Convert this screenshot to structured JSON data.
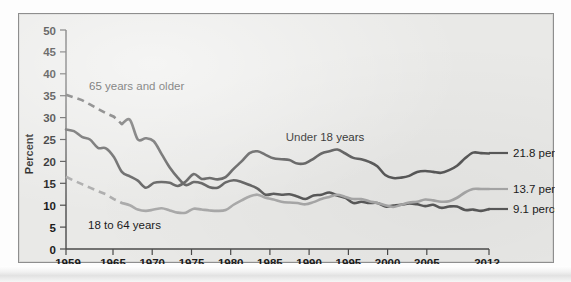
{
  "figure": {
    "y_axis_title": "Percent",
    "background_color": "#e9e9e7",
    "border_color": "#8e8e8e"
  },
  "labels": {
    "series_65": "65 years and older",
    "series_18_64": "18 to 64 years",
    "series_under18": "Under 18 years",
    "end_under18": "21.8 percent",
    "end_18_64": "13.7 percent",
    "end_65": "9.1 percent"
  },
  "chart_data": {
    "type": "line",
    "title": "",
    "xlabel": "",
    "ylabel": "Percent",
    "xlim": [
      1959,
      2012
    ],
    "ylim": [
      0,
      50
    ],
    "ytick_labels": [
      "0",
      "5",
      "10",
      "15",
      "20",
      "25",
      "30",
      "35",
      "40",
      "45",
      "50"
    ],
    "ytick_values": [
      0,
      5,
      10,
      15,
      20,
      25,
      30,
      35,
      40,
      45,
      50
    ],
    "xtick_labels": [
      "1959",
      "1965",
      "1970",
      "1975",
      "1980",
      "1985",
      "1990",
      "1995",
      "2000",
      "2005",
      "2012"
    ],
    "xtick_values": [
      1959,
      1965,
      1970,
      1975,
      1980,
      1985,
      1990,
      1995,
      2000,
      2005,
      2012
    ],
    "grid": false,
    "legend": "inline-annotations",
    "series": [
      {
        "name": "65 years and older",
        "color": "#595959",
        "style": "dashed-then-solid",
        "dashed_until": 1966,
        "end_value": 9.1,
        "end_label": "9.1 percent",
        "x": [
          1959,
          1960,
          1961,
          1962,
          1963,
          1964,
          1965,
          1966,
          1967,
          1968,
          1969,
          1970,
          1971,
          1972,
          1973,
          1974,
          1975,
          1976,
          1977,
          1978,
          1979,
          1980,
          1981,
          1982,
          1983,
          1984,
          1985,
          1986,
          1987,
          1988,
          1989,
          1990,
          1991,
          1992,
          1993,
          1994,
          1995,
          1996,
          1997,
          1998,
          1999,
          2000,
          2001,
          2002,
          2003,
          2004,
          2005,
          2006,
          2007,
          2008,
          2009,
          2010,
          2011,
          2012
        ],
        "y": [
          35.2,
          34.6,
          34.0,
          33.0,
          32.0,
          31.0,
          30.2,
          28.5,
          29.5,
          25.0,
          25.3,
          24.6,
          21.6,
          18.6,
          16.3,
          14.6,
          15.3,
          15.0,
          14.1,
          14.0,
          15.2,
          15.7,
          15.3,
          14.6,
          13.8,
          12.4,
          12.6,
          12.4,
          12.5,
          12.0,
          11.4,
          12.2,
          12.4,
          12.9,
          12.2,
          11.7,
          10.5,
          10.8,
          10.5,
          10.5,
          9.7,
          9.9,
          10.1,
          10.4,
          10.2,
          9.8,
          10.1,
          9.4,
          9.7,
          9.7,
          8.9,
          9.0,
          8.7,
          9.1
        ]
      },
      {
        "name": "Under 18 years",
        "color": "#595959",
        "style": "solid",
        "end_value": 21.8,
        "end_label": "21.8 percent",
        "x": [
          1959,
          1960,
          1961,
          1962,
          1963,
          1964,
          1965,
          1966,
          1967,
          1968,
          1969,
          1970,
          1971,
          1972,
          1973,
          1974,
          1975,
          1976,
          1977,
          1978,
          1979,
          1980,
          1981,
          1982,
          1983,
          1984,
          1985,
          1986,
          1987,
          1988,
          1989,
          1990,
          1991,
          1992,
          1993,
          1994,
          1995,
          1996,
          1997,
          1998,
          1999,
          2000,
          2001,
          2002,
          2003,
          2004,
          2005,
          2006,
          2007,
          2008,
          2009,
          2010,
          2011,
          2012
        ],
        "y": [
          27.3,
          26.9,
          25.6,
          25.0,
          23.1,
          23.0,
          21.0,
          17.6,
          16.6,
          15.6,
          14.0,
          15.1,
          15.3,
          15.1,
          14.4,
          15.4,
          17.1,
          16.0,
          16.2,
          15.9,
          16.4,
          18.3,
          20.0,
          21.9,
          22.3,
          21.5,
          20.7,
          20.5,
          20.3,
          19.5,
          19.6,
          20.6,
          21.8,
          22.3,
          22.7,
          21.8,
          20.8,
          20.5,
          19.9,
          18.9,
          16.9,
          16.2,
          16.3,
          16.7,
          17.6,
          17.8,
          17.6,
          17.4,
          18.0,
          19.0,
          20.7,
          22.0,
          21.9,
          21.8
        ]
      },
      {
        "name": "18 to 64 years",
        "color": "#a8a8a8",
        "style": "dashed-then-solid",
        "dashed_until": 1966,
        "end_value": 13.7,
        "end_label": "13.7 percent",
        "x": [
          1959,
          1960,
          1961,
          1962,
          1963,
          1964,
          1965,
          1966,
          1967,
          1968,
          1969,
          1970,
          1971,
          1972,
          1973,
          1974,
          1975,
          1976,
          1977,
          1978,
          1979,
          1980,
          1981,
          1982,
          1983,
          1984,
          1985,
          1986,
          1987,
          1988,
          1989,
          1990,
          1991,
          1992,
          1993,
          1994,
          1995,
          1996,
          1997,
          1998,
          1999,
          2000,
          2001,
          2002,
          2003,
          2004,
          2005,
          2006,
          2007,
          2008,
          2009,
          2010,
          2011,
          2012
        ],
        "y": [
          16.5,
          15.6,
          14.8,
          14.0,
          13.2,
          12.5,
          11.4,
          10.5,
          10.0,
          9.0,
          8.7,
          9.0,
          9.3,
          8.8,
          8.3,
          8.3,
          9.2,
          9.0,
          8.8,
          8.7,
          8.9,
          10.1,
          11.1,
          12.0,
          12.4,
          11.7,
          11.3,
          10.8,
          10.6,
          10.5,
          10.2,
          10.7,
          11.4,
          11.9,
          12.4,
          11.9,
          11.4,
          11.4,
          10.9,
          10.5,
          10.0,
          9.6,
          10.1,
          10.6,
          10.8,
          11.3,
          11.1,
          10.8,
          10.9,
          11.7,
          12.9,
          13.7,
          13.7,
          13.7
        ]
      }
    ]
  }
}
